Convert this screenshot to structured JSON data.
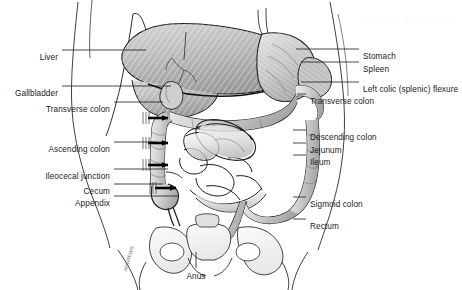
{
  "figure": {
    "background_color": "#ffffff",
    "line_color": "#1a1a1a",
    "width": 462,
    "height": 290
  },
  "labels_left": [
    {
      "text": "Liver",
      "x": 58,
      "y": 53,
      "leader_x1": 62,
      "leader_y1": 50,
      "leader_x2": 146,
      "leader_y2": 50
    },
    {
      "text": "Gallbladder",
      "x": 58,
      "y": 89,
      "leader_x1": 62,
      "leader_y1": 86,
      "leader_x2": 171,
      "leader_y2": 86
    },
    {
      "text": "Transverse colon",
      "x": 110,
      "y": 105,
      "leader_x1": 114,
      "leader_y1": 102,
      "leader_x2": 163,
      "leader_y2": 102
    },
    {
      "text": "Ascending colon",
      "x": 110,
      "y": 145,
      "leader_x1": 114,
      "leader_y1": 142,
      "leader_x2": 157,
      "leader_y2": 142
    },
    {
      "text": "Ileocecal junction",
      "x": 110,
      "y": 172,
      "leader_x1": 114,
      "leader_y1": 169,
      "leader_x2": 168,
      "leader_y2": 169
    },
    {
      "text": "Cecum",
      "x": 110,
      "y": 187,
      "leader_x1": 114,
      "leader_y1": 184,
      "leader_x2": 163,
      "leader_y2": 184
    },
    {
      "text": "Appendix",
      "x": 110,
      "y": 199,
      "leader_x1": 114,
      "leader_y1": 196,
      "leader_x2": 178,
      "leader_y2": 196
    }
  ],
  "labels_right": [
    {
      "text": "Stomach",
      "x": 363,
      "y": 52,
      "leader_x1": 359,
      "leader_y1": 49,
      "leader_x2": 296,
      "leader_y2": 49
    },
    {
      "text": "Spleen",
      "x": 363,
      "y": 65,
      "leader_x1": 359,
      "leader_y1": 62,
      "leader_x2": 301,
      "leader_y2": 62
    },
    {
      "text": "Left colic (splenic) flexure",
      "x": 363,
      "y": 85,
      "leader_x1": 359,
      "leader_y1": 82,
      "leader_x2": 301,
      "leader_y2": 82
    },
    {
      "text": "Transverse colon",
      "x": 310,
      "y": 97,
      "leader_x1": 306,
      "leader_y1": 94,
      "leader_x2": 297,
      "leader_y2": 94
    },
    {
      "text": "Descending colon",
      "x": 310,
      "y": 133,
      "leader_x1": 306,
      "leader_y1": 130,
      "leader_x2": 293,
      "leader_y2": 130
    },
    {
      "text": "Jejunum",
      "x": 310,
      "y": 146,
      "leader_x1": 306,
      "leader_y1": 143,
      "leader_x2": 293,
      "leader_y2": 143
    },
    {
      "text": "Ileum",
      "x": 310,
      "y": 158,
      "leader_x1": 306,
      "leader_y1": 155,
      "leader_x2": 293,
      "leader_y2": 155
    },
    {
      "text": "Sigmoid colon",
      "x": 310,
      "y": 200,
      "leader_x1": 306,
      "leader_y1": 197,
      "leader_x2": 293,
      "leader_y2": 197
    },
    {
      "text": "Rectum",
      "x": 310,
      "y": 222,
      "leader_x1": 306,
      "leader_y1": 219,
      "leader_x2": 293,
      "leader_y2": 219
    }
  ],
  "labels_bottom": [
    {
      "text": "Anus",
      "x": 196,
      "y": 272,
      "leader_x1": 196,
      "leader_y1": 268,
      "leader_x2": 196,
      "leader_y2": 252
    }
  ],
  "signature": {
    "text": "ANDREWS",
    "x": 122,
    "y": 270
  },
  "watermark": {
    "text": "Medical Illustration",
    "x": 360,
    "y": 14,
    "size": 11
  }
}
